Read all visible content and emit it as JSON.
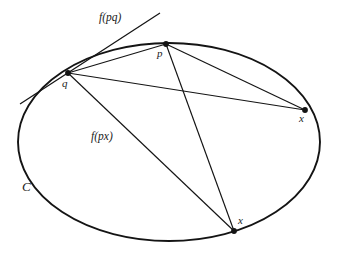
{
  "figure": {
    "type": "geometric-diagram",
    "background_color": "#ffffff",
    "stroke_color": "#141414",
    "width": 339,
    "height": 256,
    "curve": {
      "name": "C",
      "label": "C",
      "shape": "ellipse",
      "center": [
        169,
        142
      ],
      "radius_x": 151,
      "radius_y": 99,
      "label_position": [
        22,
        180
      ]
    },
    "points": [
      {
        "id": "p",
        "label": "p",
        "position": [
          166,
          44
        ],
        "label_position": [
          157,
          48
        ],
        "marker": "filled-dot"
      },
      {
        "id": "q",
        "label": "q",
        "position": [
          68,
          73
        ],
        "label_position": [
          62,
          78
        ],
        "marker": "filled-dot"
      },
      {
        "id": "x1",
        "label": "x",
        "position": [
          305,
          110
        ],
        "label_position": [
          299,
          113
        ],
        "marker": "filled-dot"
      },
      {
        "id": "x2",
        "label": "x",
        "position": [
          234,
          231
        ],
        "label_position": [
          238,
          215
        ],
        "marker": "filled-dot"
      }
    ],
    "segments": [
      {
        "id": "qp",
        "from": "q",
        "to": "p"
      },
      {
        "id": "qx1",
        "from": "q",
        "to": "x1"
      },
      {
        "id": "qx2",
        "from": "q",
        "to": "x2"
      },
      {
        "id": "px1",
        "from": "p",
        "to": "x1"
      },
      {
        "id": "px2",
        "from": "p",
        "to": "x2"
      }
    ],
    "tangent_line": {
      "id": "tangent-at-q",
      "label": "f(pq)",
      "from": [
        20,
        104
      ],
      "to": [
        160,
        13
      ],
      "label_position": [
        99,
        12
      ]
    },
    "chord_label": {
      "id": "chord-px",
      "label": "f(px)",
      "label_position": [
        91,
        131
      ]
    }
  }
}
